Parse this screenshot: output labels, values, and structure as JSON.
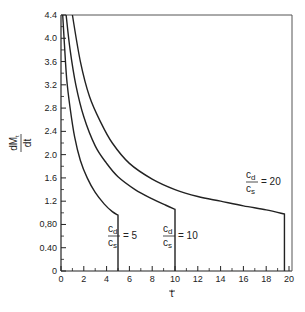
{
  "chart_data": {
    "type": "line",
    "title": "",
    "xlabel": "t",
    "ylabel": "dM_t / dt",
    "xlim": [
      0,
      20
    ],
    "ylim": [
      0,
      4.4
    ],
    "grid": false,
    "legend": "none (inline annotations)",
    "x_ticks": [
      "0",
      "2",
      "4",
      "6",
      "8",
      "10",
      "12",
      "14",
      "16",
      "18",
      "20"
    ],
    "y_ticks": [
      "0",
      "0.40",
      "0,80",
      "1.2",
      "1.6",
      "2.0",
      "2.4",
      "2.8",
      "3.2",
      "3.6",
      "4.0",
      "4.4"
    ],
    "series": [
      {
        "name": "cd/cs = 5",
        "label_num": "c",
        "label_num_sub": "d",
        "label_den": "c",
        "label_den_sub": "s",
        "label_value": "= 5",
        "x": [
          0.15,
          0.3,
          0.5,
          0.8,
          1.2,
          1.7,
          2.3,
          3.0,
          3.8,
          4.5,
          5.0,
          5.0
        ],
        "values": [
          4.4,
          3.9,
          3.3,
          2.8,
          2.3,
          1.9,
          1.6,
          1.35,
          1.15,
          1.02,
          0.96,
          0.0
        ]
      },
      {
        "name": "cd/cs = 10",
        "label_num": "c",
        "label_num_sub": "d",
        "label_den": "c",
        "label_den_sub": "s",
        "label_value": "= 10",
        "x": [
          0.45,
          0.8,
          1.3,
          2.0,
          3.0,
          4.0,
          5.0,
          6.5,
          8.0,
          9.2,
          10.0,
          10.0
        ],
        "values": [
          4.4,
          3.8,
          3.2,
          2.65,
          2.15,
          1.85,
          1.62,
          1.4,
          1.24,
          1.13,
          1.06,
          0.0
        ]
      },
      {
        "name": "cd/cs = 20",
        "label_num": "c",
        "label_num_sub": "d",
        "label_den": "c",
        "label_den_sub": "s",
        "label_value": "= 20",
        "x": [
          1.0,
          1.7,
          2.5,
          3.5,
          4.5,
          6.0,
          8.0,
          10.0,
          12.0,
          14.0,
          16.0,
          18.0,
          19.6,
          19.6
        ],
        "values": [
          4.4,
          3.6,
          3.0,
          2.55,
          2.2,
          1.85,
          1.58,
          1.4,
          1.28,
          1.2,
          1.12,
          1.05,
          0.98,
          0.0
        ]
      }
    ]
  },
  "axes": {
    "ylabel_top": "dM",
    "ylabel_top_sub": "t",
    "ylabel_bottom": "dt",
    "xlabel": "t"
  }
}
